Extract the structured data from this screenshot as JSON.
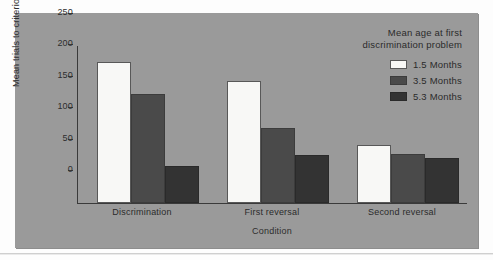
{
  "chart_data": {
    "type": "bar",
    "title": "",
    "xlabel": "Condition",
    "ylabel": "Mean trials to criterion",
    "categories": [
      "Discrimination",
      "First reversal",
      "Second reversal"
    ],
    "series": [
      {
        "name": "1.5 Months",
        "values": [
          225,
          195,
          92
        ],
        "color": "#f8f8f6"
      },
      {
        "name": "3.5 Months",
        "values": [
          174,
          120,
          78
        ],
        "color": "#4a4a4a"
      },
      {
        "name": "5.3 Months",
        "values": [
          59,
          76,
          72
        ],
        "color": "#333333"
      }
    ],
    "ylim": [
      0,
      250
    ],
    "yticks": [
      0,
      50,
      100,
      150,
      200,
      250
    ],
    "ytick_labels": [
      "0",
      "50",
      "100",
      "150",
      "200",
      "250"
    ],
    "grid": false,
    "legend_position": "top-right",
    "legend_title_lines": [
      "Mean age at first",
      "discrimination problem"
    ],
    "panel_color": "#9a9a9a",
    "page_color": "#fdfdfd",
    "axis_color": "#3a3a3a",
    "text_color": "#2b2b2b"
  }
}
